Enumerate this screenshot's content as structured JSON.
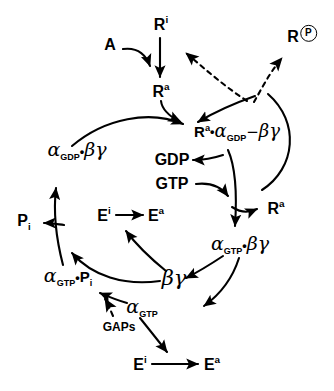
{
  "diagram": {
    "background_color": "#ffffff",
    "stroke_color": "#000000",
    "nodes": {
      "agonist": "A",
      "receptor_inactive_top": "R",
      "receptor_inactive_top_sup": "i",
      "receptor_active_top": "R",
      "receptor_active_top_sup": "a",
      "receptor_phosphorylated": "R",
      "receptor_phosphorylated_badge": "P",
      "complex_ternary_R": "R",
      "complex_ternary_R_sup": "a",
      "complex_ternary_dot": "•",
      "complex_ternary_alpha": "α",
      "complex_ternary_alpha_sub": "GDP",
      "complex_ternary_link": "−",
      "complex_ternary_bg": "βγ",
      "gdp": "GDP",
      "gtp": "GTP",
      "receptor_active_right": "R",
      "receptor_active_right_sup": "a",
      "alpha_gdp_bg_alpha": "α",
      "alpha_gdp_bg_sub": "GDP",
      "alpha_gdp_bg_dot": "•",
      "alpha_gdp_bg_bg": "βγ",
      "alpha_gtp_bg_alpha": "α",
      "alpha_gtp_bg_sub": "GTP",
      "alpha_gtp_bg_dot": "•",
      "alpha_gtp_bg_bg": "βγ",
      "beta_gamma": "βγ",
      "alpha_gtp_pi_alpha": "α",
      "alpha_gtp_pi_sub": "GTP",
      "alpha_gtp_pi_dot": "•",
      "alpha_gtp_pi_P": "P",
      "alpha_gtp_pi_P_sub": "i",
      "alpha_gtp_alpha": "α",
      "alpha_gtp_sub": "GTP",
      "phosphate_inorganic": "P",
      "phosphate_inorganic_sub": "i",
      "gaps": "GAPs",
      "effector_inactive_mid": "E",
      "effector_inactive_mid_sup": "i",
      "effector_active_mid": "E",
      "effector_active_mid_sup": "a",
      "effector_inactive_bottom": "E",
      "effector_inactive_bottom_sup": "i",
      "effector_active_bottom": "E",
      "effector_active_bottom_sup": "a"
    }
  }
}
